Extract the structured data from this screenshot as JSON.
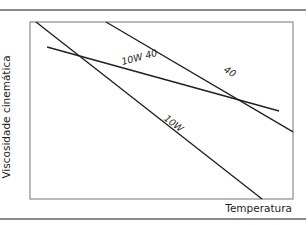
{
  "chart_data": {
    "type": "line",
    "title": "",
    "xlabel": "Temperatura",
    "ylabel": "Viscosidade cinemática",
    "xlim": [
      0,
      10
    ],
    "ylim": [
      0,
      10
    ],
    "grid": false,
    "ticks": false,
    "legend": "inline labels on lines",
    "series": [
      {
        "name": "10W",
        "x": [
          0.23,
          8.82
        ],
        "y": [
          10.0,
          0.0
        ]
      },
      {
        "name": "40",
        "x": [
          2.89,
          10.0
        ],
        "y": [
          10.0,
          3.79
        ]
      },
      {
        "name": "10W 40",
        "x": [
          0.65,
          9.47
        ],
        "y": [
          8.59,
          4.97
        ]
      }
    ],
    "annotations": [
      {
        "text": "10W 40",
        "note": "multigrade line, crosses 10W at low temperature and 40 at high temperature"
      },
      {
        "text": "40"
      },
      {
        "text": "10W"
      }
    ]
  },
  "labels": {
    "ylabel": "Viscosidade cinemática",
    "xlabel": "Temperatura",
    "series_10w40": "10W 40",
    "series_40": "40",
    "series_10w": "10W"
  },
  "colors": {
    "line": "#231f20",
    "frame": "#8a8a8a",
    "rule": "#8a8a8a",
    "background": "#ffffff"
  }
}
